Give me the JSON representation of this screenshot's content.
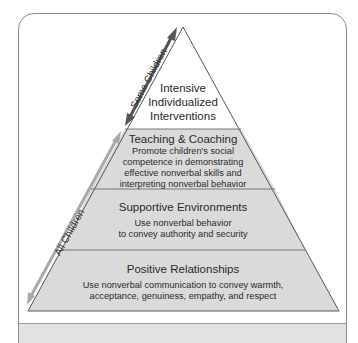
{
  "diagram": {
    "type": "pyramid",
    "colors": {
      "border": "#8e8e8e",
      "layer_fill": "#dcdcdc",
      "top_fill": "#ffffff",
      "divider": "#777777",
      "arrow_some": "#555555",
      "arrow_all": "#a9a9a9",
      "band_fill": "#e2e2e2"
    },
    "layers": [
      {
        "title": "Intensive",
        "title2": "Individualized",
        "title3": "Interventions"
      },
      {
        "title": "Teaching & Coaching",
        "lines": [
          "Promote children's social",
          "competence in demonstrating",
          "effective nonverbal skills and",
          "interpreting nonverbal behavior"
        ]
      },
      {
        "title": "Supportive Environments",
        "lines": [
          "Use nonverbal behavior",
          "to convey authority and security"
        ]
      },
      {
        "title": "Positive Relationships",
        "lines": [
          "Use nonverbal communication to convey warmth,",
          "acceptance, genuiness, empathy, and respect"
        ]
      }
    ],
    "arrows": {
      "some": "Some Children",
      "all": "All Children"
    }
  }
}
